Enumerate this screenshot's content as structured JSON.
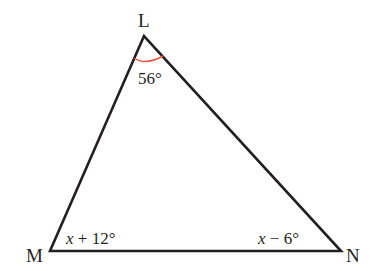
{
  "diagram": {
    "type": "triangle",
    "vertices": [
      {
        "name": "L",
        "label": "L"
      },
      {
        "name": "M",
        "label": "M"
      },
      {
        "name": "N",
        "label": "N"
      }
    ],
    "angles": {
      "L": {
        "label": "56°",
        "arc_color": "#e8553c"
      },
      "M": {
        "var": "x",
        "rest": " + 12°"
      },
      "N": {
        "var": "x",
        "rest": " − 6°"
      }
    },
    "colors": {
      "line": "#231f20",
      "arc": "#e8553c",
      "background": "#ffffff"
    }
  }
}
